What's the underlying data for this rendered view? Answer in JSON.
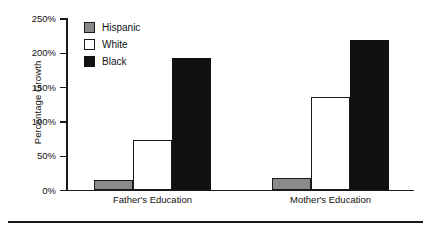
{
  "chart_data": {
    "type": "bar",
    "title": "",
    "subtitle": "",
    "xlabel": "",
    "ylabel": "Percentage Growth",
    "categories": [
      "Father's Education",
      "Mother's Education"
    ],
    "series": [
      {
        "name": "Hispanic",
        "color": "#8a8a8a",
        "values": [
          15,
          18
        ]
      },
      {
        "name": "White",
        "color": "#ffffff",
        "values": [
          73,
          137
        ]
      },
      {
        "name": "Black",
        "color": "#111111",
        "values": [
          193,
          219
        ]
      }
    ],
    "ylim": [
      0,
      250
    ],
    "ytick_values": [
      0,
      50,
      100,
      150,
      200,
      250
    ],
    "ytick_labels": [
      "0%",
      "50%",
      "100%",
      "150%",
      "200%",
      "250%"
    ],
    "grid": false,
    "legend_position": "upper-left-inside",
    "legend_entries": [
      "Hispanic",
      "White",
      "Black"
    ],
    "annotations": []
  },
  "axis": {
    "y_title": "Percentage Growth",
    "ticks": [
      {
        "label": "250%",
        "value": 250
      },
      {
        "label": "200%",
        "value": 200
      },
      {
        "label": "150%",
        "value": 150
      },
      {
        "label": "100%",
        "value": 100
      },
      {
        "label": "50%",
        "value": 50
      },
      {
        "label": "0%",
        "value": 0
      }
    ]
  },
  "legend": {
    "items": [
      {
        "label": "Hispanic",
        "swatch": "gray-swatch"
      },
      {
        "label": "White",
        "swatch": "white-swatch"
      },
      {
        "label": "Black",
        "swatch": "black-swatch"
      }
    ]
  },
  "groups": [
    {
      "label": "Father's Education",
      "bars": [
        {
          "series": "Hispanic",
          "value": 15
        },
        {
          "series": "White",
          "value": 73
        },
        {
          "series": "Black",
          "value": 193
        }
      ]
    },
    {
      "label": "Mother's Education",
      "bars": [
        {
          "series": "Hispanic",
          "value": 18
        },
        {
          "series": "White",
          "value": 137
        },
        {
          "series": "Black",
          "value": 219
        }
      ]
    }
  ]
}
